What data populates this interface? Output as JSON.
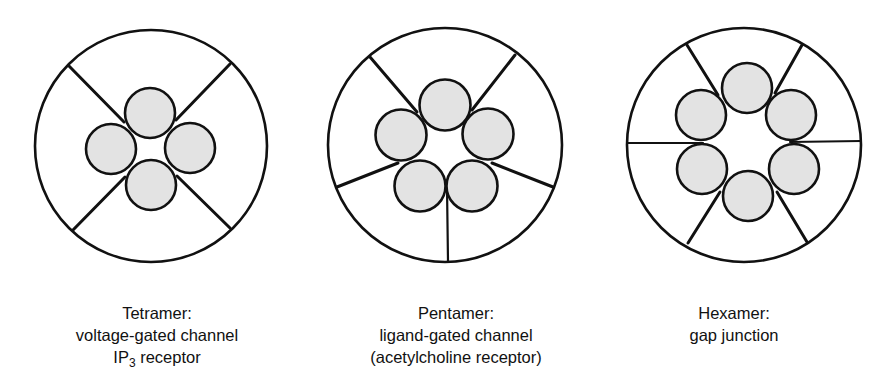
{
  "figure": {
    "colors": {
      "stroke": "#111111",
      "subunit_fill": "#e3e3e3",
      "background": "#ffffff"
    },
    "channels": [
      {
        "id": "tetramer",
        "subunit_count": 4,
        "outer": {
          "cx": 151,
          "cy": 146,
          "r": 116
        },
        "subunits": [
          {
            "cx": 150,
            "cy": 113,
            "r": 25
          },
          {
            "cx": 111,
            "cy": 149,
            "r": 25
          },
          {
            "cx": 190,
            "cy": 148,
            "r": 25
          },
          {
            "cx": 151,
            "cy": 185,
            "r": 25
          }
        ],
        "dividers": [
          {
            "x1": 69,
            "y1": 66,
            "x2": 124,
            "y2": 122
          },
          {
            "x1": 230,
            "y1": 64,
            "x2": 176,
            "y2": 120
          },
          {
            "x1": 73,
            "y1": 230,
            "x2": 125,
            "y2": 177
          },
          {
            "x1": 230,
            "y1": 228,
            "x2": 177,
            "y2": 176
          }
        ],
        "label": {
          "title": "Tetramer:",
          "line1": "voltage-gated channel",
          "line2_main": "IP",
          "line2_sub": "3",
          "line2_rest": " receptor",
          "x": 157,
          "y": 302
        }
      },
      {
        "id": "pentamer",
        "subunit_count": 5,
        "outer": {
          "cx": 445,
          "cy": 145,
          "r": 117
        },
        "subunits": [
          {
            "cx": 445,
            "cy": 105,
            "r": 25.5
          },
          {
            "cx": 401,
            "cy": 135,
            "r": 25.5
          },
          {
            "cx": 488,
            "cy": 134,
            "r": 25.5
          },
          {
            "cx": 420,
            "cy": 186,
            "r": 25.5
          },
          {
            "cx": 472,
            "cy": 186,
            "r": 25.5
          }
        ],
        "dividers": [
          {
            "x1": 370,
            "y1": 57,
            "x2": 417,
            "y2": 112,
            "thin": false
          },
          {
            "x1": 515,
            "y1": 55,
            "x2": 472,
            "y2": 110,
            "thin": false
          },
          {
            "x1": 337,
            "y1": 187,
            "x2": 398,
            "y2": 163,
            "thin": false
          },
          {
            "x1": 553,
            "y1": 187,
            "x2": 492,
            "y2": 163,
            "thin": false
          },
          {
            "x1": 448,
            "y1": 261,
            "x2": 447,
            "y2": 187,
            "thin": true
          }
        ],
        "label": {
          "title": "Pentamer:",
          "line1": "ligand-gated channel",
          "line2": "(acetylcholine receptor)",
          "x": 456,
          "y": 302
        }
      },
      {
        "id": "hexamer",
        "subunit_count": 6,
        "outer": {
          "cx": 744,
          "cy": 145,
          "r": 117
        },
        "subunits": [
          {
            "cx": 747,
            "cy": 88,
            "r": 25
          },
          {
            "cx": 701,
            "cy": 115,
            "r": 25
          },
          {
            "cx": 791,
            "cy": 115,
            "r": 25
          },
          {
            "cx": 702,
            "cy": 169,
            "r": 25
          },
          {
            "cx": 794,
            "cy": 169,
            "r": 25
          },
          {
            "cx": 748,
            "cy": 196,
            "r": 25
          }
        ],
        "dividers": [
          {
            "x1": 687,
            "y1": 45,
            "x2": 718,
            "y2": 95,
            "thin": false
          },
          {
            "x1": 802,
            "y1": 45,
            "x2": 775,
            "y2": 93,
            "thin": false
          },
          {
            "x1": 627,
            "y1": 143,
            "x2": 703,
            "y2": 143,
            "thin": true
          },
          {
            "x1": 861,
            "y1": 141,
            "x2": 790,
            "y2": 142,
            "thin": true
          },
          {
            "x1": 688,
            "y1": 243,
            "x2": 720,
            "y2": 192,
            "thin": false
          },
          {
            "x1": 807,
            "y1": 242,
            "x2": 777,
            "y2": 192,
            "thin": false
          }
        ],
        "label": {
          "title": "Hexamer:",
          "line1": "gap junction",
          "x": 734,
          "y": 302
        }
      }
    ]
  }
}
